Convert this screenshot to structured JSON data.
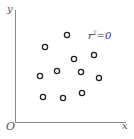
{
  "chart_data": {
    "type": "scatter",
    "title": "",
    "xlabel": "x",
    "ylabel": "y",
    "origin_label": "O",
    "annotation": "r²=0",
    "annotation_parts": {
      "base": "r",
      "sup": "2",
      "rest": "=0"
    },
    "grid": false,
    "legend": null,
    "marker": "hollow-circle",
    "points": [
      {
        "x": 67,
        "y": 35
      },
      {
        "x": 45,
        "y": 47
      },
      {
        "x": 94,
        "y": 55
      },
      {
        "x": 74,
        "y": 59
      },
      {
        "x": 57,
        "y": 71
      },
      {
        "x": 81,
        "y": 72
      },
      {
        "x": 40,
        "y": 76
      },
      {
        "x": 99,
        "y": 78
      },
      {
        "x": 43,
        "y": 97
      },
      {
        "x": 63,
        "y": 98
      },
      {
        "x": 82,
        "y": 93
      }
    ],
    "colors": {
      "axis": "#888888",
      "marker": "#222222",
      "text": "#555555"
    }
  }
}
